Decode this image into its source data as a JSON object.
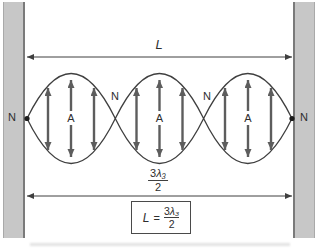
{
  "diagram": {
    "description_labels": {
      "length_label": "L",
      "node_label": "N",
      "antinode_label": "A"
    },
    "bottom_dimension": {
      "numerator_coeff": "3",
      "numerator_symbol": "λ₃",
      "denominator": "2"
    },
    "formula": {
      "lhs": "L",
      "equals": "=",
      "numerator_coeff": "3",
      "numerator_symbol": "λ₃",
      "denominator": "2"
    },
    "structure": {
      "loops": 3,
      "nodes": 4,
      "antinodes": 3
    },
    "colors": {
      "wall_fill": "#c7c7c7",
      "wall_edge": "#7a7a7a",
      "envelope_stroke": "#3f3f3f",
      "oscillation_arrow": "#5d5d5d",
      "dimension_line": "#3f3f3f",
      "text": "#2e2e2e",
      "background": "#ffffff"
    }
  }
}
